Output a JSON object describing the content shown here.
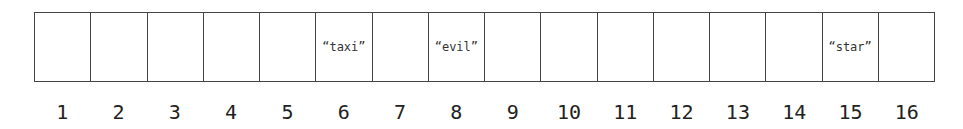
{
  "array": {
    "cells": [
      {
        "index": "1",
        "value": ""
      },
      {
        "index": "2",
        "value": ""
      },
      {
        "index": "3",
        "value": ""
      },
      {
        "index": "4",
        "value": ""
      },
      {
        "index": "5",
        "value": ""
      },
      {
        "index": "6",
        "value": "“taxi”"
      },
      {
        "index": "7",
        "value": ""
      },
      {
        "index": "8",
        "value": "“evil”"
      },
      {
        "index": "9",
        "value": ""
      },
      {
        "index": "10",
        "value": ""
      },
      {
        "index": "11",
        "value": ""
      },
      {
        "index": "12",
        "value": ""
      },
      {
        "index": "13",
        "value": ""
      },
      {
        "index": "14",
        "value": ""
      },
      {
        "index": "15",
        "value": "“star”"
      },
      {
        "index": "16",
        "value": ""
      }
    ]
  }
}
